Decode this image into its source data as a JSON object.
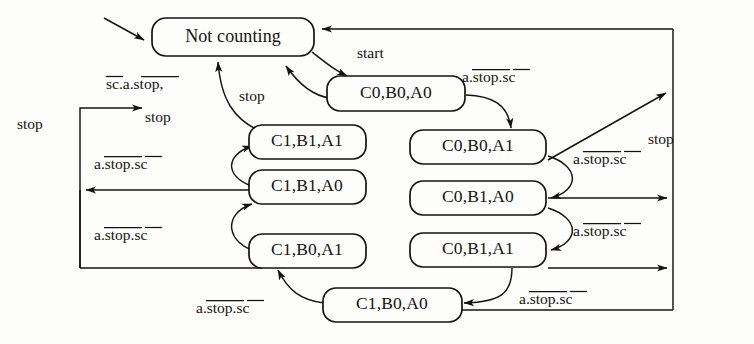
{
  "figure": {
    "type": "state-transition-diagram"
  },
  "states": [
    {
      "id": "not-counting",
      "label": "Not counting",
      "x": 232,
      "y": 37,
      "w": 162,
      "h": 38
    },
    {
      "id": "c0b0a0",
      "label": "C0,B0,A0",
      "x": 396,
      "y": 93,
      "w": 138,
      "h": 35
    },
    {
      "id": "c1b1a1",
      "label": "C1,B1,A1",
      "x": 307,
      "y": 142,
      "w": 118,
      "h": 35
    },
    {
      "id": "c1b1a0",
      "label": "C1,B1,A0",
      "x": 307,
      "y": 186,
      "w": 118,
      "h": 35
    },
    {
      "id": "c1b0a1",
      "label": "C1,B0,A1",
      "x": 307,
      "y": 250,
      "w": 118,
      "h": 35
    },
    {
      "id": "c0b0a1",
      "label": "C0,B0,A1",
      "x": 477,
      "y": 147,
      "w": 136,
      "h": 35
    },
    {
      "id": "c0b1a0",
      "label": "C0,B1,A0",
      "x": 477,
      "y": 198,
      "w": 136,
      "h": 35
    },
    {
      "id": "c0b1a1",
      "label": "C0,B1,A1",
      "x": 477,
      "y": 250,
      "w": 136,
      "h": 35
    },
    {
      "id": "c1b0a0",
      "label": "C1,B0,A0",
      "x": 387,
      "y": 306,
      "w": 128,
      "h": 35
    }
  ],
  "edge_labels": [
    {
      "id": "start",
      "text": "start",
      "kind": "plain",
      "x": 357,
      "y": 54
    },
    {
      "id": "stop-left-rail",
      "text": "stop",
      "kind": "plain",
      "x": 17,
      "y": 125
    },
    {
      "id": "stop-right-rail",
      "text": "stop",
      "kind": "plain",
      "x": 693,
      "y": 140
    },
    {
      "id": "stop-mid",
      "text": "stop",
      "kind": "plain",
      "x": 258,
      "y": 97
    },
    {
      "id": "stop-under",
      "text": "stop",
      "kind": "plain",
      "x": 158,
      "y": 118
    },
    {
      "id": "sc-a-stop-comma",
      "text": "sc.a.stop,",
      "kind": "overline-sc-a-stop-comma",
      "x": 113,
      "y": 85
    },
    {
      "id": "astopsc-1",
      "text": "a.stop.sc",
      "kind": "overline-a-stop-sc",
      "x": 487,
      "y": 78
    },
    {
      "id": "astopsc-2",
      "text": "a.stop.sc",
      "kind": "overline-a-stop-sc",
      "x": 100,
      "y": 165
    },
    {
      "id": "astopsc-3",
      "text": "a.stop.sc",
      "kind": "overline-a-stop-sc",
      "x": 100,
      "y": 236
    },
    {
      "id": "astopsc-4",
      "text": "a.stop.sc",
      "kind": "overline-a-stop-sc",
      "x": 573,
      "y": 160
    },
    {
      "id": "astopsc-5",
      "text": "a.stop.sc",
      "kind": "overline-a-stop-sc",
      "x": 573,
      "y": 232
    },
    {
      "id": "astopsc-6",
      "text": "a.stop.sc",
      "kind": "overline-a-stop-sc",
      "x": 196,
      "y": 309
    },
    {
      "id": "astopsc-7",
      "text": "a.stop.sc",
      "kind": "overline-a-stop-sc",
      "x": 519,
      "y": 300
    }
  ],
  "symbols": {
    "a": "a",
    "dot": ".",
    "stop": "stop",
    "sc": "sc",
    "comma": ",",
    "start": "start",
    "stop_plain": "stop"
  },
  "colors": {
    "ink": "#15130f",
    "paper": "#fdfdfb"
  }
}
